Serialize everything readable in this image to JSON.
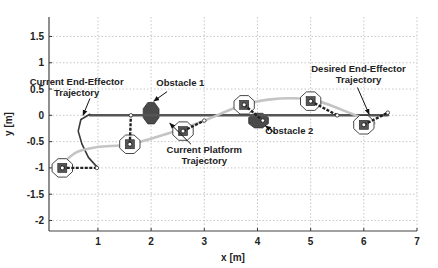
{
  "chart_data": {
    "type": "line",
    "title": "",
    "xlabel": "x [m]",
    "ylabel": "y [m]",
    "xlim": [
      0.08,
      7.0
    ],
    "ylim": [
      -2.2,
      1.87
    ],
    "grid": true,
    "x_ticks": [
      1,
      2,
      3,
      4,
      5,
      6,
      7
    ],
    "y_ticks": [
      1.5,
      1,
      0.5,
      0,
      -0.5,
      -1,
      -1.5,
      -2
    ],
    "y_tick_labels": [
      "1.5",
      "1",
      "0.5",
      "0",
      "-0.5",
      "-1",
      "-1.5",
      "-2"
    ],
    "x_tick_labels": [
      "1",
      "2",
      "3",
      "4",
      "5",
      "6",
      "7"
    ],
    "series": [
      {
        "name": "Desired End-Effector Trajectory",
        "color": "#555555",
        "points": [
          [
            0.85,
            0.0
          ],
          [
            6.45,
            0.0
          ]
        ]
      },
      {
        "name": "Current End-Effector Trajectory",
        "color": "#3a3a3a",
        "points": [
          [
            0.85,
            0.02
          ],
          [
            0.68,
            -0.08
          ],
          [
            0.63,
            -0.3
          ],
          [
            0.7,
            -0.55
          ],
          [
            0.82,
            -0.8
          ],
          [
            0.98,
            -0.98
          ]
        ]
      },
      {
        "name": "Current Platform Trajectory",
        "color": "#c4c4c4",
        "points": [
          [
            0.3,
            -0.95
          ],
          [
            0.6,
            -0.7
          ],
          [
            1.0,
            -0.6
          ],
          [
            1.6,
            -0.55
          ],
          [
            2.3,
            -0.35
          ],
          [
            3.0,
            -0.1
          ],
          [
            3.6,
            0.15
          ],
          [
            4.2,
            0.3
          ],
          [
            5.0,
            0.3
          ],
          [
            5.6,
            0.1
          ],
          [
            6.2,
            -0.15
          ]
        ]
      }
    ],
    "obstacles": [
      {
        "name": "Obstacle 1",
        "x": 2.0,
        "y": 0.04,
        "rx": 0.16,
        "ry": 0.22
      },
      {
        "name": "Obstacle 2",
        "x": 4.02,
        "y": -0.1,
        "rx": 0.2,
        "ry": 0.15
      }
    ],
    "robots": [
      {
        "x": 0.33,
        "y": -1.0,
        "angle": 0,
        "arm": [
          [
            0.33,
            -1.0
          ],
          [
            0.98,
            -1.0
          ]
        ]
      },
      {
        "x": 1.6,
        "y": -0.55,
        "angle": 0,
        "arm": [
          [
            1.6,
            -0.55
          ],
          [
            1.62,
            0.0
          ]
        ]
      },
      {
        "x": 2.6,
        "y": -0.3,
        "angle": 0,
        "arm": [
          [
            2.6,
            -0.3
          ],
          [
            3.0,
            -0.1
          ]
        ]
      },
      {
        "x": 3.75,
        "y": 0.2,
        "angle": 0,
        "arm": [
          [
            3.75,
            0.2
          ],
          [
            4.1,
            -0.1
          ]
        ]
      },
      {
        "x": 5.0,
        "y": 0.27,
        "angle": 0,
        "arm": [
          [
            5.0,
            0.27
          ],
          [
            5.5,
            0.0
          ]
        ]
      },
      {
        "x": 6.0,
        "y": -0.18,
        "angle": 0,
        "arm": [
          [
            6.0,
            -0.18
          ],
          [
            6.45,
            0.05
          ]
        ]
      }
    ],
    "annotations": [
      {
        "id": "ee-current",
        "lines": [
          "Current End-Effector",
          "Trajectory"
        ],
        "text_x": 0.6,
        "text_y": 0.58,
        "arrow_from": [
          0.85,
          0.32
        ],
        "arrow_to": [
          0.72,
          0.0
        ]
      },
      {
        "id": "obstacle1",
        "lines": [
          "Obstacle 1"
        ],
        "text_x": 2.55,
        "text_y": 0.55,
        "arrow_from": [
          2.3,
          0.45
        ],
        "arrow_to": [
          2.05,
          0.27
        ]
      },
      {
        "id": "desired-ee",
        "lines": [
          "Desired End-Effector",
          "Trajectory"
        ],
        "text_x": 5.9,
        "text_y": 0.82,
        "arrow_from": [
          5.88,
          0.53
        ],
        "arrow_to": [
          6.1,
          0.02
        ]
      },
      {
        "id": "obstacle2",
        "lines": [
          "Obstacle 2"
        ],
        "text_x": 4.6,
        "text_y": -0.36,
        "arrow_from": [
          4.35,
          -0.35
        ],
        "arrow_to": [
          4.15,
          -0.2
        ]
      },
      {
        "id": "platform",
        "lines": [
          "Current Platform",
          "Trajectory"
        ],
        "text_x": 3.0,
        "text_y": -0.72,
        "arrow_from": [
          2.75,
          -0.55
        ],
        "arrow_to": [
          2.35,
          -0.15
        ]
      }
    ]
  }
}
